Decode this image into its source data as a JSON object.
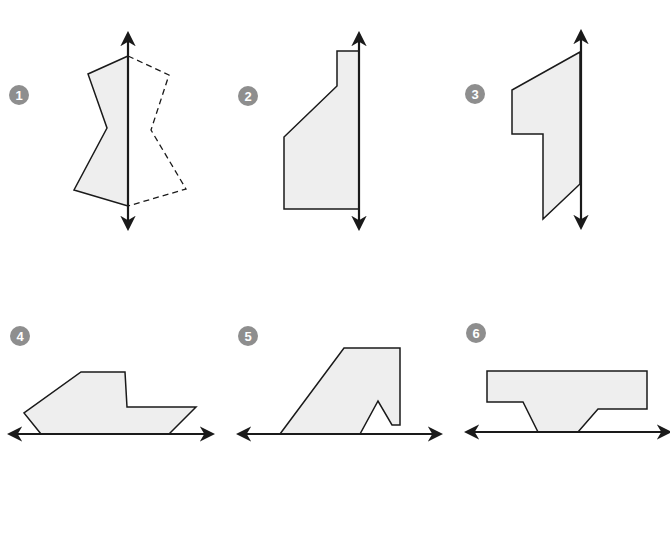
{
  "colors": {
    "stroke": "#1a1a1a",
    "fill": "#eeeeee",
    "badge": "#8e8e8e",
    "badge_text": "#ffffff"
  },
  "figures": [
    {
      "label": "1",
      "badge": {
        "cx": 19,
        "cy": 95
      },
      "axis": {
        "orientation": "vertical",
        "x1": 128,
        "y1": 34,
        "x2": 128,
        "y2": 228
      },
      "shape": "128,56 88,74 107,128 74,190 128,206",
      "reflection": "128,56 169,75 151,130 186,189 128,206"
    },
    {
      "label": "2",
      "badge": {
        "cx": 248,
        "cy": 96
      },
      "axis": {
        "orientation": "vertical",
        "x1": 359,
        "y1": 34,
        "x2": 359,
        "y2": 228
      },
      "shape": "359,51 337,51 337,86 284,137 284,209 359,209",
      "reflection": ""
    },
    {
      "label": "3",
      "badge": {
        "cx": 475,
        "cy": 94
      },
      "axis": {
        "orientation": "vertical",
        "x1": 581,
        "y1": 32,
        "x2": 581,
        "y2": 227
      },
      "shape": "580,52 512,90 512,134 543,134 543,219 580,184",
      "reflection": ""
    },
    {
      "label": "4",
      "badge": {
        "cx": 20,
        "cy": 336
      },
      "axis": {
        "orientation": "horizontal",
        "x1": 10,
        "y1": 434,
        "x2": 212,
        "y2": 434
      },
      "shape": "41,434 24,413 81,372 125,372 127,407 196,407 169,434",
      "reflection": ""
    },
    {
      "label": "5",
      "badge": {
        "cx": 248,
        "cy": 336
      },
      "axis": {
        "orientation": "horizontal",
        "x1": 239,
        "y1": 434,
        "x2": 440,
        "y2": 434
      },
      "shape": "280,434 344,348 400,348 400,425 392,425 378,401 360,434",
      "reflection": ""
    },
    {
      "label": "6",
      "badge": {
        "cx": 476,
        "cy": 333
      },
      "axis": {
        "orientation": "horizontal",
        "x1": 467,
        "y1": 432,
        "x2": 669,
        "y2": 432
      },
      "shape": "487,371 647,371 647,409 598,409 578,432 538,432 523,402 487,402",
      "reflection": ""
    }
  ]
}
